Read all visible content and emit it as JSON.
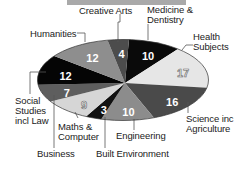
{
  "chart_data": {
    "type": "pie",
    "title": "",
    "unit": "%",
    "categories": [
      "Medicine & Dentistry",
      "Health Subjects",
      "Science inc Agriculture",
      "Engineering",
      "Built Environment",
      "Maths & Computer",
      "Business",
      "Social Studies incl Law",
      "Humanities",
      "Creative Arts"
    ],
    "values": [
      10,
      17,
      16,
      10,
      3,
      9,
      7,
      12,
      12,
      4
    ],
    "colors": [
      "#0a0a0a",
      "#e6e6e6",
      "#4a4a4a",
      "#8c8c8c",
      "#111111",
      "#d6d6d6",
      "#5e5e5e",
      "#050505",
      "#8e8e8e",
      "#4c4c4c"
    ],
    "text_colors": [
      "#ffffff",
      "#f4f4f4",
      "#ffffff",
      "#ffffff",
      "#ffffff",
      "#f4f4f4",
      "#ffffff",
      "#ffffff",
      "#ffffff",
      "#ffffff"
    ],
    "start_angle_deg": -86,
    "shape": "ellipse"
  },
  "labels": {
    "medicine": "Medicine &\nDentistry",
    "health": "Health\nSubjects",
    "science": "Science inc\nAgriculture",
    "engineering": "Engineering",
    "built": "Built Environment",
    "maths": "Maths &\nComputer",
    "business": "Business",
    "social": "Social\nStudies\nincl Law",
    "humanities": "Humanities",
    "creative": "Creative Arts"
  }
}
